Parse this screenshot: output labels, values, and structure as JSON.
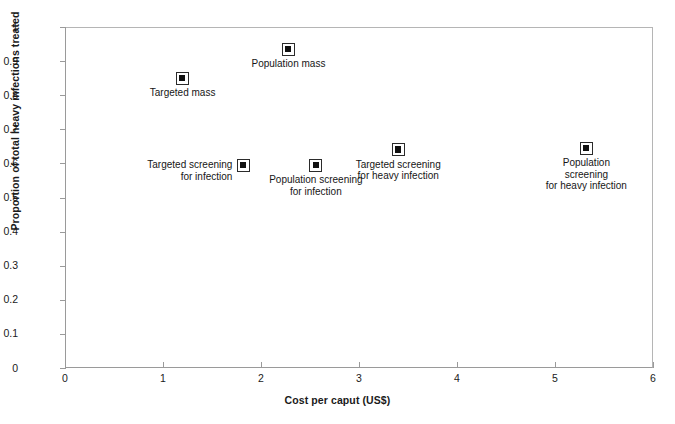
{
  "chart_data": {
    "type": "scatter",
    "title": "",
    "xlabel": "Cost per caput (US$)",
    "ylabel": "Proportion of total heavy infections treated",
    "xlim": [
      0,
      6
    ],
    "ylim": [
      0,
      1
    ],
    "grid": false,
    "legend": "none (points labelled in-plot)",
    "xticks": [
      "0",
      "1",
      "2",
      "3",
      "4",
      "5",
      "6"
    ],
    "yticks": [
      "0",
      "0.1",
      "0.2",
      "0.3",
      "0.4",
      "0.5",
      "0.6",
      "0.7",
      "0.8",
      "0.9",
      "1"
    ],
    "marker_style": "open square with filled black centre",
    "points": [
      {
        "label": "Targeted mass",
        "x": 1.2,
        "y": 0.85,
        "label_position": "below-center"
      },
      {
        "label": "Population mass",
        "x": 2.28,
        "y": 0.935,
        "label_position": "below-center"
      },
      {
        "label": "Targeted screening\nfor infection",
        "x": 1.82,
        "y": 0.595,
        "label_position": "left"
      },
      {
        "label": "Population screening\nfor infection",
        "x": 2.56,
        "y": 0.595,
        "label_position": "below-center"
      },
      {
        "label": "Targeted screening\nfor heavy infection",
        "x": 3.4,
        "y": 0.64,
        "label_position": "below-center"
      },
      {
        "label": "Population screening\nfor heavy infection",
        "x": 5.32,
        "y": 0.645,
        "label_position": "below-center"
      }
    ]
  },
  "colors": {
    "background": "#ffffff",
    "axis": "#9a9a9a",
    "marker_outline": "#2b2b2b",
    "marker_fill": "#111111",
    "text": "#161616"
  }
}
